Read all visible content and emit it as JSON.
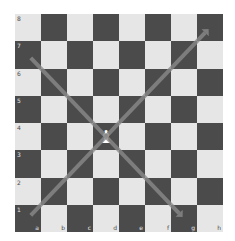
{
  "board": {
    "files": [
      "a",
      "b",
      "c",
      "d",
      "e",
      "f",
      "g",
      "h"
    ],
    "ranks": [
      "8",
      "7",
      "6",
      "5",
      "4",
      "3",
      "2",
      "1"
    ],
    "colors": {
      "light": "#e6e6e6",
      "dark": "#4b4b4b",
      "arrow": "#8a8a8a"
    },
    "pieces": [
      {
        "square": "d4",
        "type": "bishop",
        "color": "white",
        "glyph": "♝"
      }
    ],
    "arrows": [
      {
        "from": "a1",
        "to": "h8"
      },
      {
        "from": "a7",
        "to": "g1"
      }
    ]
  }
}
